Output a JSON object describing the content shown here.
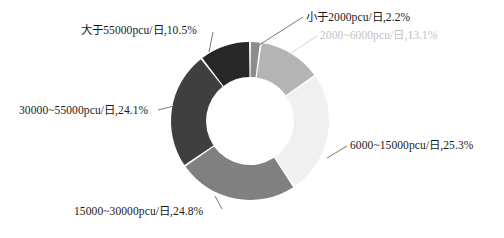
{
  "chart_data": {
    "type": "pie",
    "variant": "donut",
    "title": "",
    "subtitle": "",
    "xlabel": "",
    "ylabel": "",
    "legend_position": "none",
    "grid": false,
    "label_format": "{category},{percent}%",
    "start_angle_deg": 0,
    "direction": "clockwise",
    "categories": [
      "小于2000pcu/日",
      "2000~6000pcu/日",
      "6000~15000pcu/日",
      "15000~30000pcu/日",
      "30000~55000pcu/日",
      "大于55000pcu/日"
    ],
    "values": [
      2.2,
      13.1,
      25.3,
      24.8,
      24.1,
      10.5
    ],
    "units": "%",
    "colors": [
      "#8c8c8c",
      "#b4b4b4",
      "#f0f0f0",
      "#808080",
      "#3f3f3f",
      "#272727"
    ],
    "slices": [
      {
        "category": "小于2000pcu/日",
        "percent": 2.2,
        "label": "小于2000pcu/日,2.2%",
        "color": "#8c8c8c",
        "label_color": "#1a1a1a",
        "faded": false
      },
      {
        "category": "2000~6000pcu/日",
        "percent": 13.1,
        "label": "2000~6000pcu/日,13.1%",
        "color": "#b4b4b4",
        "label_color": "#c2c2c2",
        "faded": true
      },
      {
        "category": "6000~15000pcu/日",
        "percent": 25.3,
        "label": "6000~15000pcu/日,25.3%",
        "color": "#f0f0f0",
        "label_color": "#1a1a1a",
        "faded": false
      },
      {
        "category": "15000~30000pcu/日",
        "percent": 24.8,
        "label": "15000~30000pcu/日,24.8%",
        "color": "#808080",
        "label_color": "#1a1a1a",
        "faded": false
      },
      {
        "category": "30000~55000pcu/日",
        "percent": 24.1,
        "label": "30000~55000pcu/日,24.1%",
        "color": "#3f3f3f",
        "label_color": "#1a1a1a",
        "faded": false
      },
      {
        "category": "大于55000pcu/日",
        "percent": 10.5,
        "label": "大于55000pcu/日,10.5%",
        "color": "#272727",
        "label_color": "#1a1a1a",
        "faded": false
      }
    ],
    "geometry": {
      "center_x": 250,
      "center_y": 121,
      "outer_radius": 79,
      "inner_radius": 44,
      "gap_deg": 1.4
    },
    "leader_lines": [
      {
        "category": "小于2000pcu/日",
        "from": [
          259,
          45
        ],
        "to": [
          303,
          17
        ]
      },
      {
        "category": "2000~6000pcu/日",
        "from": [
          288,
          55
        ],
        "to": [
          317,
          36
        ]
      },
      {
        "category": "6000~15000pcu/日",
        "from": [
          327,
          158
        ],
        "to": [
          347,
          146
        ]
      },
      {
        "category": "15000~30000pcu/日",
        "from": [
          215,
          196
        ],
        "to": [
          222,
          209
        ]
      },
      {
        "category": "30000~55000pcu/日",
        "from": [
          174,
          106
        ],
        "to": [
          158,
          110
        ]
      },
      {
        "category": "大于55000pcu/日",
        "from": [
          209,
          52
        ],
        "to": [
          213,
          32
        ]
      }
    ]
  },
  "background_color": "#ffffff"
}
